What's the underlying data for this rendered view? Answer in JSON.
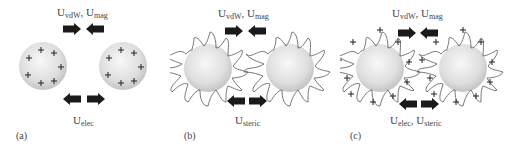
{
  "panels": [
    {
      "id": "a",
      "tag": "(a)",
      "attraction_label": {
        "main": "U",
        "sub1": "vdW",
        "sep": ", U",
        "sub2": "mag"
      },
      "repulsion_label": {
        "main": "U",
        "sub1": "elec",
        "sep": "",
        "sub2": ""
      },
      "particle_type": "charged-sphere",
      "charge_symbol": "+"
    },
    {
      "id": "b",
      "tag": "(b)",
      "attraction_label": {
        "main": "U",
        "sub1": "vdW",
        "sep": ", U",
        "sub2": "mag"
      },
      "repulsion_label": {
        "main": "U",
        "sub1": "steric",
        "sep": "",
        "sub2": ""
      },
      "particle_type": "polymer-coated-sphere"
    },
    {
      "id": "c",
      "tag": "(c)",
      "attraction_label": {
        "main": "U",
        "sub1": "vdW",
        "sep": ", U",
        "sub2": "mag"
      },
      "repulsion_label": {
        "main": "U",
        "sub1": "elec",
        "sep": ", U",
        "sub2": "steric"
      },
      "particle_type": "charged-polymer-coated-sphere",
      "charge_symbol": "+"
    }
  ],
  "colors": {
    "arrow": "#1a1a1a",
    "sphere_light": "#f4f4f4",
    "sphere_dark": "#c8c8c8",
    "polymer_line": "#555555",
    "text": "#444444"
  }
}
